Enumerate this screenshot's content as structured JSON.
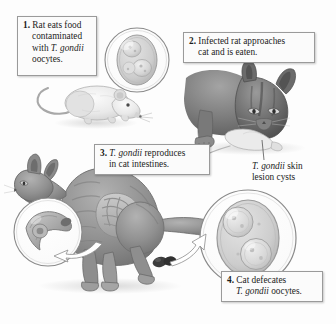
{
  "figure": {
    "background_color": "#fdfdfd",
    "callout_bg": "#fbfbfb",
    "callout_border": "#9a9a9a"
  },
  "callouts": [
    {
      "number": "1.",
      "line1": "Rat eats food",
      "line2": "contaminated",
      "line3_pre": "with ",
      "line3_ital": "T. gondii",
      "line4": "oocytes."
    },
    {
      "number": "2.",
      "line1": "Infected rat approaches",
      "line2": "cat and is eaten."
    },
    {
      "number": "3.",
      "line1_ital": "T. gondii",
      "line1_post": " reproduces",
      "line2": "in cat intestines."
    },
    {
      "number": "4.",
      "line1": "Cat defecates",
      "line2_ital": "T. gondii",
      "line2_post": " oocytes."
    }
  ],
  "leader_labels": [
    {
      "ital": "T. gondii",
      "post": " skin",
      "line2": "lesion cysts"
    }
  ],
  "illustrations": [
    {
      "name": "rat-illustration",
      "description": "white rat facing right with long curved tail"
    },
    {
      "name": "oocyte-magnifier-top",
      "description": "circular magnified view of T. gondii oocyte with sporocysts"
    },
    {
      "name": "cat-eating-rat-illustration",
      "description": "dark gray cat with head lowered eating a rat"
    },
    {
      "name": "cat-defecating-illustration",
      "description": "gray cat in squat posture showing intestines"
    },
    {
      "name": "tachyzoite-magnifier",
      "description": "circular magnified crescent-shaped tachyzoite with nucleus"
    },
    {
      "name": "oocyte-magnifier-bottom",
      "description": "circular magnified oocyte containing two sporocysts"
    },
    {
      "name": "feces-pellets",
      "description": "dark fecal pellets on ground"
    },
    {
      "name": "arrow-tachyzoite",
      "description": "white hollow arrow from cat intestines to tachyzoite magnifier"
    },
    {
      "name": "arrow-oocyte",
      "description": "white hollow arrow from feces to oocyte magnifier"
    },
    {
      "name": "leader-line-skin-lesion",
      "description": "thin leader line from rat in cat mouth to skin lesion label"
    }
  ],
  "colors": {
    "cat_dark": "#5d5d5d",
    "cat_mid": "#8c8c8c",
    "cat_light": "#b9b9b9",
    "rat_light": "#e6e6e6",
    "outline": "#6e6e6e",
    "magnifier_ring": "#8a8a8a",
    "feces": "#3a3a3a",
    "text": "#1b1b1b"
  }
}
